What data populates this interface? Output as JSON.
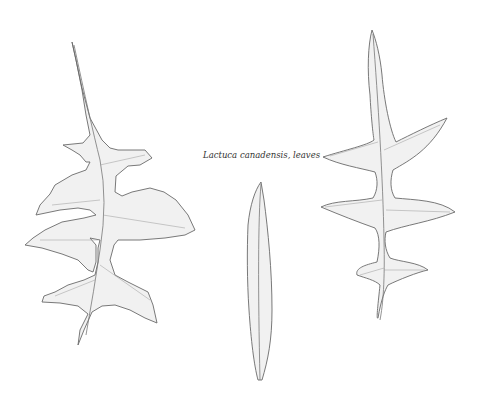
{
  "illustration": {
    "caption": "Lactuca canadensis, leaves",
    "leaves": [
      {
        "name": "pinnatifid-toothed-leaf",
        "position": "left"
      },
      {
        "name": "lanceolate-entire-leaf",
        "position": "center"
      },
      {
        "name": "pinnatifid-narrow-lobed-leaf",
        "position": "right"
      }
    ]
  }
}
